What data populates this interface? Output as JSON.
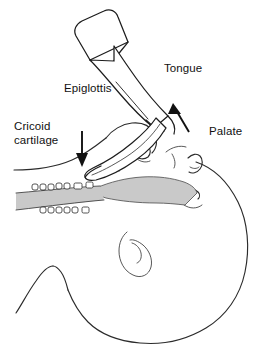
{
  "figure": {
    "background_color": "#ffffff",
    "line_color": "#2b2b2b",
    "tongue_fill_color": "#c9c9c9",
    "arrow_color": "#111111"
  },
  "labels": {
    "tongue": "Tongue",
    "epiglottis": "Epiglottis",
    "cricoid_line1": "Cricoid",
    "cricoid_line2": "cartilage",
    "palate": "Palate"
  },
  "annotations": {
    "lift_arrow": "lift-arrow",
    "cricoid_pressure_arrow": "cricoid-pressure-arrow",
    "epiglottis_leader": "epiglottis-leader-line"
  },
  "instrument": {
    "name": "laryngoscope",
    "parts": [
      "handle",
      "handle-band",
      "blade-shaft",
      "blade-tip"
    ]
  },
  "anatomy_parts": [
    "head-outline",
    "cheek",
    "nose-profile",
    "lip-profile",
    "ear",
    "chin-jaw-curve",
    "neck-outline",
    "upper-teeth",
    "lower-teeth",
    "tongue-mass",
    "epiglottis-structure",
    "cricoid-cartilage-line",
    "trachea-line"
  ]
}
